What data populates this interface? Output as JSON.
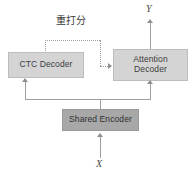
{
  "diagram": {
    "nodes": {
      "ctc_decoder": {
        "label": "CTC Decoder",
        "fill": "#d4d4d4",
        "stroke": "#bdbdbd"
      },
      "attention_decoder": {
        "label_line1": "Attention",
        "label_line2": "Decoder",
        "fill": "#d4d4d4",
        "stroke": "#bdbdbd"
      },
      "shared_encoder": {
        "label": "Shared Encoder",
        "fill": "#a8a8a8",
        "stroke": "#9a9a9a"
      }
    },
    "labels": {
      "rescore": "重打分",
      "input": "X",
      "output": "Y"
    },
    "edges": [
      {
        "name": "input-to-shared-encoder",
        "from": "X",
        "to": "shared_encoder",
        "style": "solid",
        "arrow": "up"
      },
      {
        "name": "shared-encoder-to-ctc-decoder",
        "from": "shared_encoder",
        "to": "ctc_decoder",
        "style": "solid",
        "arrow": "up"
      },
      {
        "name": "shared-encoder-to-attention-decoder",
        "from": "shared_encoder",
        "to": "attention_decoder",
        "style": "solid",
        "arrow": "up"
      },
      {
        "name": "ctc-decoder-to-attention-decoder-rescore",
        "from": "ctc_decoder",
        "to": "attention_decoder",
        "style": "dotted",
        "arrow": "right",
        "label": "重打分"
      },
      {
        "name": "attention-decoder-to-output",
        "from": "attention_decoder",
        "to": "Y",
        "style": "solid",
        "arrow": "up"
      }
    ],
    "line_color": "#9e9e9e",
    "dotted_color": "#a0a0a0"
  }
}
